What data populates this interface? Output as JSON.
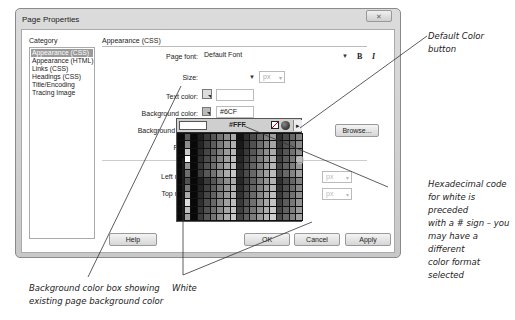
{
  "dialog": {
    "title": "Page Properties",
    "close_label": "✕",
    "category": {
      "label": "Category",
      "items": [
        "Appearance (CSS)",
        "Appearance (HTML)",
        "Links (CSS)",
        "Headings (CSS)",
        "Title/Encoding",
        "Tracing Image"
      ],
      "selected_index": 0
    },
    "section_title": "Appearance (CSS)",
    "fields": {
      "page_font_label": "Page font:",
      "page_font_value": "Default Font",
      "bold_label": "B",
      "italic_label": "I",
      "size_label": "Size:",
      "size_value": "",
      "size_unit": "px",
      "text_color_label": "Text color:",
      "text_color_value": "",
      "bg_color_label": "Background color:",
      "bg_color_value": "#6CF",
      "bg_image_label": "Background image:",
      "browse_label": "Browse...",
      "repeat_label": "Repeat:",
      "left_margin_label": "Left margin:",
      "left_margin_unit": "px",
      "top_margin_label": "Top margin:",
      "top_margin_unit": "px"
    },
    "buttons": {
      "help": "Help",
      "ok": "OK",
      "cancel": "Cancel",
      "apply": "Apply"
    }
  },
  "color_picker": {
    "hex_value": "#FFF",
    "preview_color": "#FFFFFF",
    "icons": [
      "default-color",
      "system-color-picker",
      "palette-menu"
    ]
  },
  "annotations": {
    "default_color": "Default Color button",
    "default_color_l1": "Default Color",
    "default_color_l2": "button",
    "hex_l1": "Hexadecimal code",
    "hex_l2": "for white is preceded",
    "hex_l3": "with a # sign – you",
    "hex_l4": "may have a different",
    "hex_l5": "color format selected",
    "bg_box_l1": "Background color box showing",
    "bg_box_l2": "existing page background color",
    "white": "White"
  }
}
